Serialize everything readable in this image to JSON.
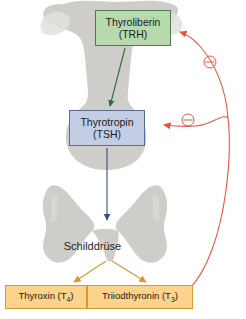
{
  "figure": {
    "background_color": "#ffffff"
  },
  "nodes": {
    "trh": {
      "line1": "Thyroliberin",
      "line2": "(TRH)",
      "fill": "#b7d9ad",
      "border": "#4e7c46"
    },
    "tsh": {
      "line1": "Thyrotropin",
      "line2": "(TSH)",
      "fill": "#c3cde4",
      "border": "#5a6a99"
    },
    "t4": {
      "text": "Thyroxin (T",
      "sub": "4",
      "tail": ")",
      "fill": "#fbd38a",
      "border": "#d79a33"
    },
    "t3": {
      "text": "Triiodthyronin (T",
      "sub": "3",
      "tail": ")",
      "fill": "#fbd38a",
      "border": "#d79a33"
    },
    "thyroid_label": "Schilddrüse"
  },
  "anatomy": {
    "gland_fill": "#cfcdc9",
    "hypothalamus_name": "hypothalamus-shape",
    "pituitary_name": "pituitary-shape",
    "thyroid_name": "thyroid-gland-shape"
  },
  "arrows": {
    "trh_to_tsh": {
      "color": "#2f6b35",
      "label": "stimulation"
    },
    "tsh_to_thyroid": {
      "color": "#3a4f7a",
      "label": "stimulation"
    },
    "thyroid_to_t4": {
      "color": "#e0942f",
      "label": "secretion"
    },
    "thyroid_to_t3": {
      "color": "#e0942f",
      "label": "secretion"
    },
    "t4_to_t3": {
      "color": "#1b1b1b",
      "label": "conversion"
    },
    "feedback_to_trh": {
      "color": "#e2583f",
      "sign": "⊖",
      "label": "negative feedback"
    },
    "feedback_to_tsh": {
      "color": "#e2583f",
      "sign": "⊖",
      "label": "negative feedback"
    }
  }
}
